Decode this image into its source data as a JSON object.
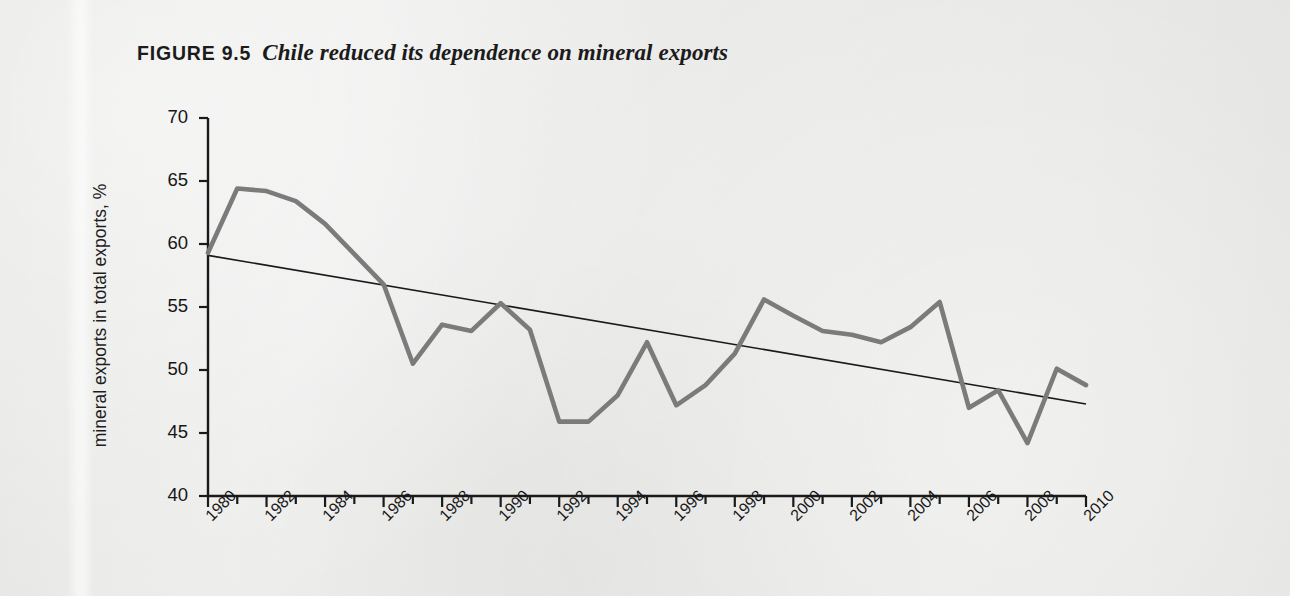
{
  "figure": {
    "label": "FIGURE 9.5",
    "caption": "Chile reduced its dependence on mineral exports"
  },
  "colors": {
    "page_background": "#ececeb",
    "data_line": "#7b7b7b",
    "trend_line": "#1a1a1a",
    "axis": "#1a1a1a",
    "text": "#161616"
  },
  "chart_data": {
    "type": "line",
    "title": "Chile reduced its dependence on mineral exports",
    "xlabel": "",
    "ylabel": "mineral exports in total exports, %",
    "xlim": [
      1980,
      2010
    ],
    "ylim": [
      40,
      70
    ],
    "ytick_labels": [
      "70",
      "65",
      "60",
      "55",
      "50",
      "45",
      "40"
    ],
    "ytick_values": [
      70,
      65,
      60,
      55,
      50,
      45,
      40
    ],
    "xtick_labels": [
      "1980",
      "1982",
      "1984",
      "1986",
      "1988",
      "1990",
      "1992",
      "1994",
      "1996",
      "1998",
      "2000",
      "2002",
      "2004",
      "2006",
      "2008",
      "2010"
    ],
    "xtick_values": [
      1980,
      1982,
      1984,
      1986,
      1988,
      1990,
      1992,
      1994,
      1996,
      1998,
      2000,
      2002,
      2004,
      2006,
      2008,
      2010
    ],
    "minor_xticks_every": 1,
    "grid": false,
    "legend": null,
    "x": [
      1980,
      1981,
      1982,
      1983,
      1984,
      1985,
      1986,
      1987,
      1988,
      1989,
      1990,
      1991,
      1992,
      1993,
      1994,
      1995,
      1996,
      1997,
      1998,
      1999,
      2000,
      2001,
      2002,
      2003,
      2004,
      2005,
      2006,
      2007,
      2008,
      2009,
      2010
    ],
    "series": [
      {
        "name": "mineral exports in total exports, %",
        "type": "line",
        "color": "#7b7b7b",
        "width": 4.6,
        "values": [
          59.3,
          64.4,
          64.2,
          63.4,
          61.6,
          59.2,
          56.8,
          50.5,
          53.6,
          53.1,
          55.3,
          53.2,
          45.9,
          45.9,
          48.0,
          52.2,
          47.2,
          48.8,
          51.3,
          55.6,
          54.3,
          53.1,
          52.8,
          52.2,
          53.4,
          55.4,
          47.0,
          48.4,
          44.2,
          50.1,
          48.8
        ]
      },
      {
        "name": "linear trend",
        "type": "trend",
        "color": "#1a1a1a",
        "width": 1.6,
        "endpoints": [
          {
            "x": 1980,
            "y": 59.1
          },
          {
            "x": 2010,
            "y": 47.3
          }
        ]
      }
    ]
  }
}
